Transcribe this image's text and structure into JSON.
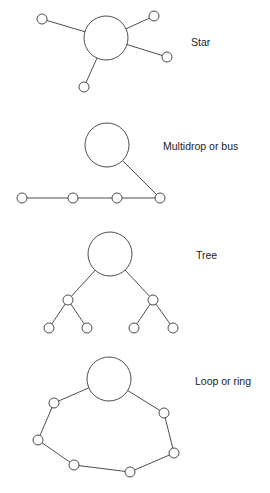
{
  "diagram": {
    "colors": {
      "stroke": "#3a3a3a",
      "fill": "#ffffff",
      "text": "#222222"
    },
    "topologies": [
      {
        "id": "star",
        "label": "Star",
        "label_pos": [
          191,
          36
        ],
        "hub": {
          "cx": 106,
          "cy": 38,
          "r": 22
        },
        "nodes": [
          [
            42,
            19
          ],
          [
            154,
            16
          ],
          [
            167,
            57
          ],
          [
            84,
            87
          ]
        ],
        "edges": "hub-to-each-node"
      },
      {
        "id": "bus",
        "label": "Multidrop or bus",
        "label_pos": [
          163,
          140
        ],
        "hub": {
          "cx": 107,
          "cy": 145,
          "r": 22
        },
        "nodes": [
          [
            22,
            198
          ],
          [
            73,
            198
          ],
          [
            117,
            198
          ],
          [
            160,
            198
          ]
        ],
        "edges": "chain-of-nodes-plus-hub-to-last"
      },
      {
        "id": "tree",
        "label": "Tree",
        "label_pos": [
          196,
          249
        ],
        "hub": {
          "cx": 110,
          "cy": 254,
          "r": 22
        },
        "nodes": [
          [
            68,
            300
          ],
          [
            153,
            300
          ],
          [
            49,
            328
          ],
          [
            87,
            328
          ],
          [
            134,
            328
          ],
          [
            173,
            328
          ]
        ],
        "edges": "hub-to-mid-then-mid-to-leaves"
      },
      {
        "id": "ring",
        "label": "Loop or ring",
        "label_pos": [
          195,
          375
        ],
        "hub": {
          "cx": 109,
          "cy": 379,
          "r": 22
        },
        "nodes": [
          [
            54,
            403
          ],
          [
            38,
            440
          ],
          [
            74,
            465
          ],
          [
            130,
            472
          ],
          [
            174,
            453
          ],
          [
            164,
            413
          ]
        ],
        "edges": "closed-loop-through-hub"
      }
    ]
  }
}
